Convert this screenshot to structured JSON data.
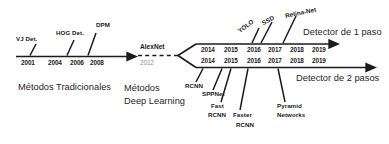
{
  "diagram": {
    "colors": {
      "ink": "#1b1b1b",
      "faded": "#8d8d8d",
      "background": "#ffffff"
    },
    "traditional": {
      "caption": "Métodos Tradicionales",
      "years": [
        "2001",
        "2004",
        "2006",
        "2008"
      ],
      "milestones": [
        "VJ Det.",
        "HOG Det.",
        "DPM"
      ]
    },
    "transition": {
      "caption_line1": "Métodos",
      "caption_line2": "Deep Learning",
      "milestone": "AlexNet",
      "year": "2012"
    },
    "one_stage": {
      "caption": "Detector de 1 paso",
      "years": [
        "2014",
        "2015",
        "2016",
        "2017",
        "2018",
        "2019"
      ],
      "milestones": [
        "YOLO",
        "SSD",
        "Retina-Net"
      ]
    },
    "two_stage": {
      "caption": "Detector de 2 pasos",
      "years": [
        "2014",
        "2015",
        "2016",
        "2017",
        "2018",
        "2019"
      ],
      "milestones": [
        "RCNN",
        "SPPNet",
        "Fast",
        "RCNN",
        "Faster",
        "RCNN",
        "Pyramid",
        "Networks"
      ],
      "milestone_groups": [
        {
          "line1": "RCNN",
          "line2": ""
        },
        {
          "line1": "SPPNet",
          "line2": ""
        },
        {
          "line1": "Fast",
          "line2": "RCNN"
        },
        {
          "line1": "Faster",
          "line2": "RCNN"
        },
        {
          "line1": "Pyramid",
          "line2": "Networks"
        }
      ]
    }
  }
}
